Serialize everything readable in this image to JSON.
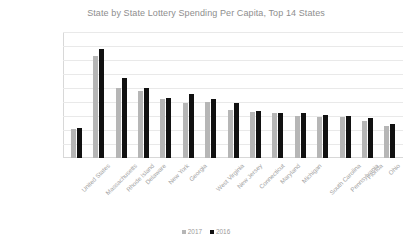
{
  "chart_data": {
    "type": "bar",
    "title": "State by State Lottery Spending Per Capita, Top 14 States",
    "xlabel": "",
    "ylabel": "",
    "ylim": [
      0,
      900
    ],
    "ytick_step": 100,
    "ytick_labels": [
      "$900.00",
      "$800.00",
      "$700.00",
      "$600.00",
      "$500.00",
      "$400.00",
      "$300.00",
      "$200.00",
      "$100.00",
      "$0.00"
    ],
    "grid": true,
    "legend_position": "bottom-center",
    "categories": [
      "United States",
      "Massachusetts",
      "Rhode Island",
      "Delaware",
      "New York",
      "Georgia",
      "West Virginia",
      "New Jersey",
      "Connecticut",
      "Maryland",
      "Michigan",
      "South Carolina",
      "Pennsylvania",
      "Florida",
      "Ohio"
    ],
    "series": [
      {
        "name": "2017",
        "color": "#b6b6b6",
        "values": [
          205,
          730,
          500,
          480,
          425,
          395,
          400,
          345,
          330,
          320,
          300,
          295,
          290,
          265,
          230
        ]
      },
      {
        "name": "2016",
        "color": "#111111",
        "values": [
          215,
          780,
          570,
          500,
          430,
          460,
          420,
          390,
          335,
          325,
          320,
          310,
          300,
          285,
          240
        ]
      }
    ]
  },
  "legend": {
    "items": [
      {
        "label": "2017"
      },
      {
        "label": "2016"
      }
    ]
  }
}
